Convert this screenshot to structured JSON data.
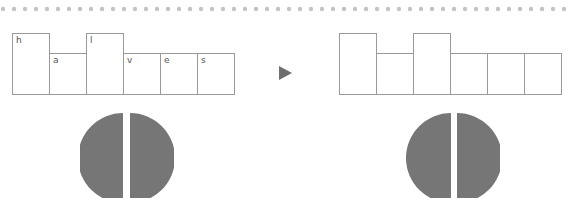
{
  "header": {
    "dot_color": "#c4c4c4",
    "dot_count": 52
  },
  "left_word": {
    "boxes": [
      {
        "label": "h",
        "tall": true
      },
      {
        "label": "a",
        "tall": false
      },
      {
        "label": "l",
        "tall": true
      },
      {
        "label": "v",
        "tall": false
      },
      {
        "label": "e",
        "tall": false
      },
      {
        "label": "s",
        "tall": false
      }
    ]
  },
  "arrow": {
    "icon": "play-triangle-icon",
    "color": "#6e6e6e"
  },
  "right_word": {
    "boxes": [
      {
        "label": "",
        "tall": true
      },
      {
        "label": "",
        "tall": false
      },
      {
        "label": "",
        "tall": true
      },
      {
        "label": "",
        "tall": false
      },
      {
        "label": "",
        "tall": false
      },
      {
        "label": "",
        "tall": false
      }
    ]
  },
  "circles": {
    "fill": "#767676",
    "split": "halves"
  }
}
